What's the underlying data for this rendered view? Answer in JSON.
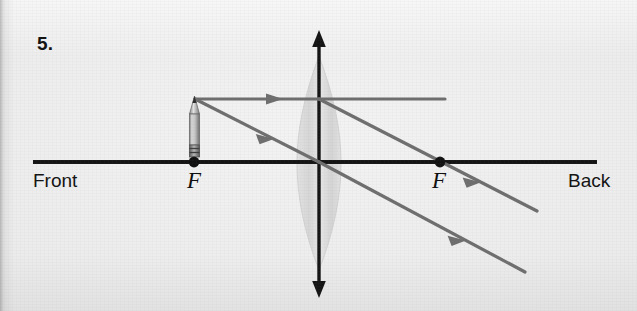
{
  "page": {
    "background_color": "#eaeaea",
    "width": 637,
    "height": 311
  },
  "question": {
    "number_label": "5."
  },
  "diagram": {
    "type": "converging-lens-ray-diagram",
    "ink_color": "#141414",
    "ray_color": "#6e6e6e",
    "lens_fill": "#dcdcdc",
    "axis": {
      "label_left": "Front",
      "label_right": "Back",
      "y": 162,
      "x_start": 33,
      "x_end": 597
    },
    "focal_points": [
      {
        "label": "F",
        "side": "left",
        "x": 194,
        "y": 162
      },
      {
        "label": "F",
        "side": "right",
        "x": 440,
        "y": 162
      }
    ],
    "lens": {
      "center_x": 319,
      "top_y": 56,
      "bottom_y": 270,
      "half_width": 22,
      "principal_axis_arrow": {
        "top_tip_y": 31,
        "bottom_tip_y": 296,
        "double_headed": true
      }
    },
    "object": {
      "name": "pencil",
      "base_x": 194,
      "base_y": 162,
      "tip_y": 97,
      "height_px": 65
    },
    "rays": [
      {
        "name": "parallel-ray",
        "points": "195,99 445,99",
        "segment_type": "horizontal-incident",
        "arrow_at": {
          "x": 277,
          "y": 99
        }
      },
      {
        "name": "parallel-ray-refracted",
        "points": "319,99 537,211",
        "segment_type": "refracted-through-back-focus",
        "arrow_at": {
          "x": 470,
          "y": 177
        }
      },
      {
        "name": "center-ray",
        "points": "195,99 319,162",
        "segment_type": "incident-to-lens-center",
        "arrow_at": {
          "x": 268,
          "y": 136
        }
      },
      {
        "name": "center-ray-continued",
        "points": "319,162 525,272",
        "segment_type": "undeviated-through-center",
        "arrow_at": {
          "x": 455,
          "y": 235
        }
      }
    ]
  }
}
